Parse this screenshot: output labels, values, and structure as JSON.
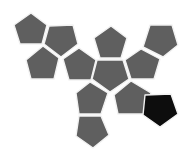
{
  "diagram": {
    "type": "dodecahedron-net",
    "face_count": 12,
    "colors": {
      "background": "#ffffff",
      "face_default": "#5f5f5f",
      "face_highlight": "#0d0d0d",
      "edge_gap": "#f2f2f2"
    },
    "faces": [
      {
        "id": "f1",
        "points": "31,13 47,25 42,44 20,44 14,25",
        "highlight": false
      },
      {
        "id": "f2",
        "points": "49,26 73,25 78,44 61,57 44,44",
        "highlight": false
      },
      {
        "id": "f3",
        "points": "43,46 59,58 54,79 31,79 26,60",
        "highlight": false
      },
      {
        "id": "f4",
        "points": "63,59 79,48 96,60 91,80 69,80",
        "highlight": false
      },
      {
        "id": "f5",
        "points": "111,26 127,38 121,58 100,58 94,38",
        "highlight": false
      },
      {
        "id": "f6",
        "points": "97,60 123,60 129,79 110,92 92,79",
        "highlight": false
      },
      {
        "id": "f7",
        "points": "150,25 172,25 178,45 163,57 143,47",
        "highlight": false
      },
      {
        "id": "f8",
        "points": "141,49 160,59 154,79 131,79 125,60",
        "highlight": false
      },
      {
        "id": "f9",
        "points": "90,82 108,93 101,114 79,114 76,93",
        "highlight": false
      },
      {
        "id": "f10",
        "points": "131,81 151,93 144,114 118,114 114,95",
        "highlight": false
      },
      {
        "id": "f11",
        "points": "145,95 171,94 178,114 160,127 143,115",
        "highlight": true
      },
      {
        "id": "f12",
        "points": "79,116 101,116 109,135 93,148 76,136",
        "highlight": false
      }
    ]
  }
}
